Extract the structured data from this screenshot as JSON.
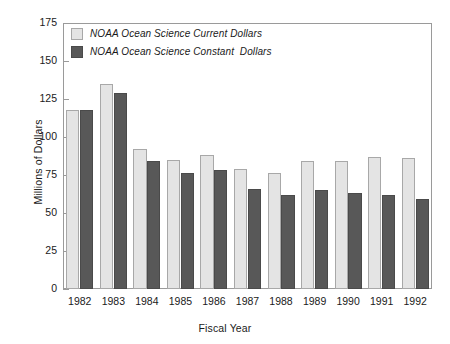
{
  "chart_data": {
    "type": "bar",
    "title": "",
    "xlabel": "Fiscal Year",
    "ylabel": "Millions of Dollars",
    "categories": [
      "1982",
      "1983",
      "1984",
      "1985",
      "1986",
      "1987",
      "1988",
      "1989",
      "1990",
      "1991",
      "1992"
    ],
    "series": [
      {
        "name": "NOAA Ocean Science Current Dollars",
        "color": "#e4e4e4",
        "values": [
          118,
          135,
          92,
          85,
          88,
          79,
          76,
          84,
          84,
          87,
          86
        ]
      },
      {
        "name": "NOAA Ocean Science Constant  Dollars",
        "color": "#585858",
        "values": [
          118,
          129,
          84,
          76,
          78,
          66,
          62,
          65,
          63,
          62,
          59
        ]
      }
    ],
    "ylim": [
      0,
      175
    ],
    "yticks": [
      0,
      25,
      50,
      75,
      100,
      125,
      150,
      175
    ],
    "ytick_labels": [
      "0",
      "25",
      "50",
      "75",
      "100",
      "125",
      "150",
      "175"
    ],
    "grid": false,
    "legend_position": "top-left"
  },
  "axes": {
    "y_title": "Millions of Dollars",
    "x_title": "Fiscal Year"
  },
  "legend": {
    "entries": [
      {
        "label": "NOAA Ocean Science Current Dollars",
        "color": "#e4e4e4"
      },
      {
        "label": "NOAA Ocean Science Constant  Dollars",
        "color": "#585858"
      }
    ]
  },
  "colors": {
    "series_current": "#e4e4e4",
    "series_constant": "#585858",
    "axis": "#9a9a9a",
    "text": "#1a1a1a",
    "background": "#ffffff"
  }
}
